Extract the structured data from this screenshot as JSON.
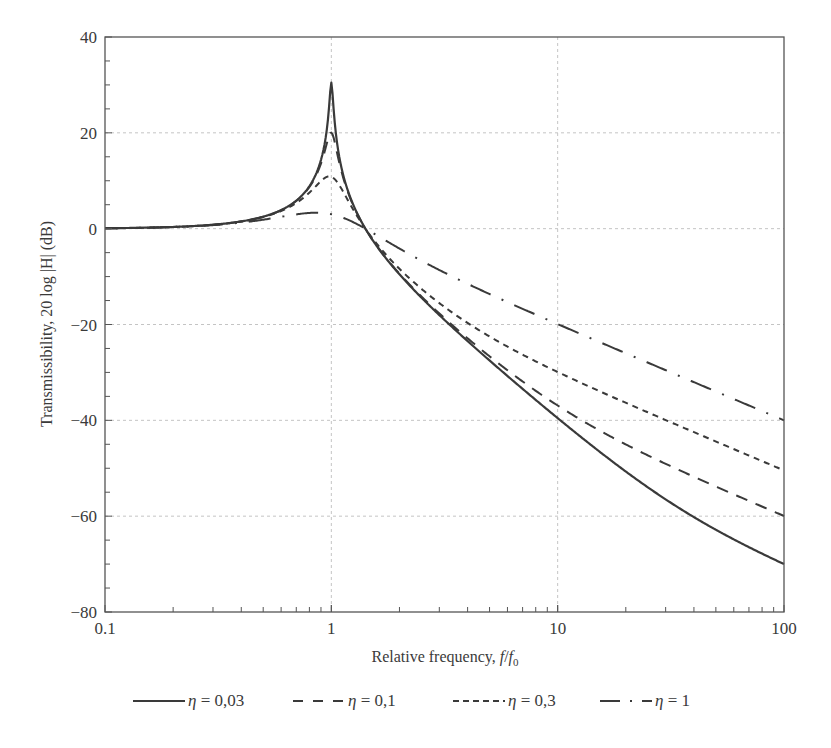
{
  "chart_data": {
    "type": "line",
    "title": "",
    "xlabel": "Relative frequency, f/f0",
    "xlabel_parts": {
      "main": "Relative frequency, ",
      "var": "f",
      "slash": "/",
      "var2": "f",
      "sub": "0"
    },
    "ylabel": "Transmissibility, 20 log |H| (dB)",
    "xscale": "log",
    "xlim": [
      0.1,
      100
    ],
    "ylim": [
      -80,
      40
    ],
    "x_ticks": [
      0.1,
      1,
      10,
      100
    ],
    "x_tick_labels": [
      "0.1",
      "1",
      "10",
      "100"
    ],
    "y_ticks": [
      -80,
      -60,
      -40,
      -20,
      0,
      20,
      40
    ],
    "y_tick_labels": [
      "−80",
      "−60",
      "−40",
      "−20",
      "0",
      "20",
      "40"
    ],
    "y_minor_step": 5,
    "grid": true,
    "legend_position": "bottom",
    "x": [
      0.1,
      0.15,
      0.2,
      0.3,
      0.4,
      0.5,
      0.6,
      0.7,
      0.8,
      0.85,
      0.9,
      0.93,
      0.95,
      0.97,
      0.98,
      0.99,
      1.0,
      1.01,
      1.02,
      1.03,
      1.05,
      1.07,
      1.1,
      1.15,
      1.2,
      1.3,
      1.414,
      1.6,
      2,
      2.5,
      3,
      4,
      5,
      7,
      10,
      15,
      20,
      30,
      50,
      70,
      100
    ],
    "series": [
      {
        "name": "η = 0,03",
        "eta": 0.03,
        "style": "solid",
        "values": [
          0.09,
          0.2,
          0.35,
          0.82,
          1.51,
          2.5,
          3.88,
          5.84,
          8.85,
          11.1,
          14.34,
          17.21,
          19.87,
          23.63,
          26.14,
          28.94,
          30.46,
          28.79,
          25.91,
          23.32,
          19.4,
          16.57,
          13.45,
          9.78,
          7.11,
          3.21,
          0.0,
          -3.86,
          -9.53,
          -14.38,
          -18.03,
          -23.46,
          -27.51,
          -33.44,
          -39.54,
          -46.2,
          -50.68,
          -56.5,
          -62.84,
          -66.47,
          -70.0
        ]
      },
      {
        "name": "η = 0,1",
        "eta": 0.1,
        "style": "long-dash",
        "values": [
          0.09,
          0.2,
          0.35,
          0.82,
          1.51,
          2.49,
          3.85,
          5.79,
          8.69,
          10.78,
          13.58,
          15.74,
          17.36,
          18.93,
          19.56,
          19.96,
          20.04,
          19.79,
          19.24,
          18.49,
          16.72,
          14.94,
          12.56,
          9.37,
          6.88,
          3.14,
          0.0,
          -3.8,
          -9.39,
          -14.15,
          -17.69,
          -22.88,
          -26.64,
          -31.89,
          -36.9,
          -41.89,
          -45.03,
          -49.07,
          -53.81,
          -56.81,
          -59.96
        ]
      },
      {
        "name": "η = 0,3",
        "eta": 0.3,
        "style": "short-dash",
        "values": [
          0.09,
          0.2,
          0.35,
          0.81,
          1.49,
          2.43,
          3.68,
          5.36,
          7.52,
          8.75,
          9.93,
          10.5,
          10.76,
          10.9,
          10.91,
          10.89,
          10.83,
          10.73,
          10.6,
          10.43,
          10.01,
          9.49,
          8.6,
          7.0,
          5.43,
          2.63,
          0.0,
          -3.35,
          -8.38,
          -12.55,
          -15.54,
          -19.68,
          -22.5,
          -26.3,
          -29.92,
          -33.73,
          -36.34,
          -39.94,
          -44.41,
          -47.35,
          -50.45
        ]
      },
      {
        "name": "η = 1",
        "eta": 1,
        "style": "dash-dot",
        "values": [
          0.09,
          0.19,
          0.34,
          0.75,
          1.27,
          1.87,
          2.47,
          2.98,
          3.29,
          3.33,
          3.3,
          3.25,
          3.19,
          3.13,
          3.09,
          3.05,
          3.01,
          2.97,
          2.92,
          2.87,
          2.76,
          2.65,
          2.46,
          2.12,
          1.74,
          0.94,
          0.0,
          -1.47,
          -4.15,
          -6.69,
          -8.63,
          -11.52,
          -13.64,
          -16.73,
          -19.91,
          -23.48,
          -26.0,
          -29.53,
          -33.98,
          -36.9,
          -40.0
        ]
      }
    ]
  },
  "legend": {
    "items": [
      {
        "symbol": "η",
        "text": " = 0,03",
        "style": "solid"
      },
      {
        "symbol": "η",
        "text": " = 0,1",
        "style": "long-dash"
      },
      {
        "symbol": "η",
        "text": " = 0,3",
        "style": "short-dash"
      },
      {
        "symbol": "η",
        "text": " = 1",
        "style": "dash-dot"
      }
    ]
  },
  "colors": {
    "line": "#3a3a3a",
    "axis": "#555555",
    "grid": "#c4c4c4",
    "text": "#3a3a3a"
  }
}
